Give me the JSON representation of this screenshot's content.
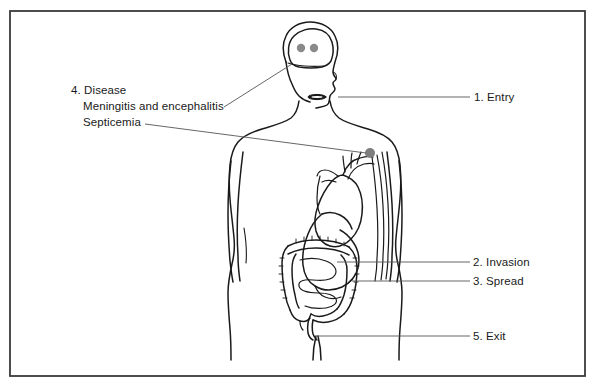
{
  "diagram": {
    "border_color": "#333333",
    "background_color": "#ffffff",
    "outline_color": "#1a1a1a",
    "pathogen_color": "#808080",
    "leader_color": "#555555"
  },
  "labels": {
    "entry": "1. Entry",
    "invasion": "2. Invasion",
    "spread": "3. Spread",
    "exit": "5. Exit",
    "disease": "4. Disease",
    "disease_line2": "Meningitis and encephalitis",
    "disease_line3": "Septicemia"
  },
  "markers": {
    "brain_pathogen_1": "pathogen-dot-brain-left",
    "brain_pathogen_2": "pathogen-dot-brain-right",
    "blood_pathogen": "pathogen-dot-bloodstream"
  },
  "anatomy": {
    "head": "head-outline",
    "brain": "brain-outline",
    "mouth": "mouth",
    "body": "body-silhouette",
    "arm_left": "left-arm",
    "arm_right": "right-arm",
    "heart": "heart",
    "stomach": "stomach",
    "small_intestine": "small-intestine",
    "large_intestine": "large-intestine",
    "rectum": "rectum",
    "blood_vessels": "blood-vessels",
    "legs": "legs"
  }
}
